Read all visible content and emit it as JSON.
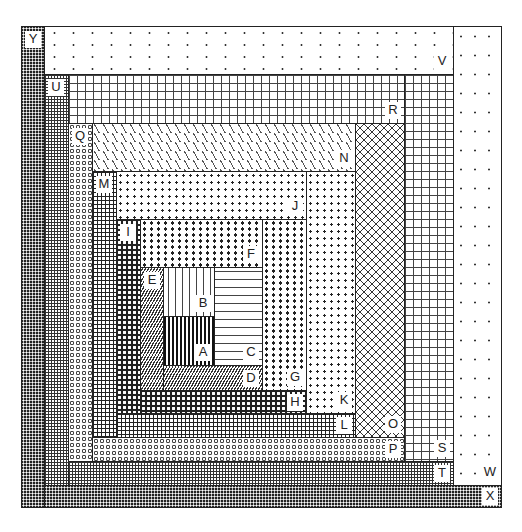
{
  "diagram": {
    "type": "log-cabin-quilt-block",
    "pieces": [
      {
        "id": "A",
        "label": "A",
        "pattern": "vertical-stripes-dark",
        "position": "center"
      },
      {
        "id": "B",
        "label": "B",
        "pattern": "vertical-dashes",
        "position": "above-A"
      },
      {
        "id": "C",
        "label": "C",
        "pattern": "horizontal-dashes",
        "position": "right-of-A-B"
      },
      {
        "id": "D",
        "label": "D",
        "pattern": "diagonal-hatch",
        "position": "below-A-C"
      },
      {
        "id": "E",
        "label": "E",
        "pattern": "diagonal-hatch",
        "position": "left-round-1"
      },
      {
        "id": "F",
        "label": "F",
        "pattern": "triangle-dots",
        "position": "top-round-1"
      },
      {
        "id": "G",
        "label": "G",
        "pattern": "triangle-dots",
        "position": "right-round-1"
      },
      {
        "id": "H",
        "label": "H",
        "pattern": "dark-triangles",
        "position": "bottom-round-1"
      },
      {
        "id": "I",
        "label": "I",
        "pattern": "dark-triangles",
        "position": "left-round-2"
      },
      {
        "id": "J",
        "label": "J",
        "pattern": "medium-dots",
        "position": "top-round-2"
      },
      {
        "id": "K",
        "label": "K",
        "pattern": "medium-dots",
        "position": "right-round-2"
      },
      {
        "id": "L",
        "label": "L",
        "pattern": "bold-grid",
        "position": "bottom-round-2"
      },
      {
        "id": "M",
        "label": "M",
        "pattern": "bold-grid",
        "position": "left-round-3"
      },
      {
        "id": "N",
        "label": "N",
        "pattern": "zigzag",
        "position": "top-round-3"
      },
      {
        "id": "O",
        "label": "O",
        "pattern": "vees",
        "position": "right-round-3"
      },
      {
        "id": "P",
        "label": "P",
        "pattern": "small-circles",
        "position": "bottom-round-3"
      },
      {
        "id": "Q",
        "label": "Q",
        "pattern": "small-circles",
        "position": "left-round-4"
      },
      {
        "id": "R",
        "label": "R",
        "pattern": "large-grid",
        "position": "top-round-4"
      },
      {
        "id": "S",
        "label": "S",
        "pattern": "large-grid",
        "position": "right-round-4"
      },
      {
        "id": "T",
        "label": "T",
        "pattern": "fine-grid",
        "position": "bottom-round-4"
      },
      {
        "id": "U",
        "label": "U",
        "pattern": "fine-grid",
        "position": "left-round-5"
      },
      {
        "id": "V",
        "label": "V",
        "pattern": "sparse-dots",
        "position": "top-round-5"
      },
      {
        "id": "W",
        "label": "W",
        "pattern": "sparse-dots",
        "position": "right-round-5"
      },
      {
        "id": "X",
        "label": "X",
        "pattern": "dark-checker",
        "position": "bottom-round-5"
      },
      {
        "id": "Y",
        "label": "Y",
        "pattern": "dark-checker",
        "position": "left-round-6"
      }
    ]
  }
}
